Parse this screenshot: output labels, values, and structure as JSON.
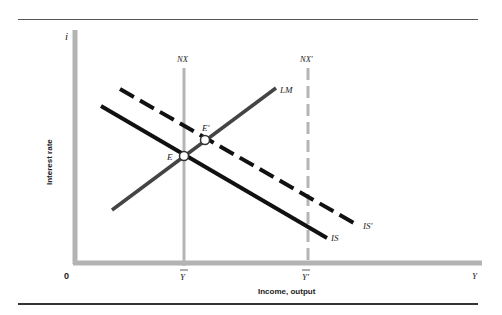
{
  "figure": {
    "type": "IS-LM diagram with NX schedule",
    "axes": {
      "y_axis_symbol": "i",
      "y_axis_title": "Interest rate",
      "x_axis_symbol": "Y",
      "x_axis_title": "Income, output",
      "origin_label": "0"
    },
    "x_ticks": [
      {
        "label": "Y̅",
        "key": "Ybar"
      },
      {
        "label": "Y̅′",
        "key": "Ybar_prime"
      }
    ],
    "curves": [
      {
        "name": "IS",
        "label": "IS",
        "style": "solid",
        "color": "#111111"
      },
      {
        "name": "IS_prime",
        "label": "IS′",
        "style": "dashed",
        "color": "#111111"
      },
      {
        "name": "LM",
        "label": "LM",
        "style": "solid",
        "color": "#444444"
      },
      {
        "name": "NX",
        "label": "NX",
        "style": "solid",
        "color": "#b5b5b5"
      },
      {
        "name": "NX_prime",
        "label": "NX′",
        "style": "dashed",
        "color": "#b5b5b5"
      }
    ],
    "points": [
      {
        "name": "E",
        "label": "E"
      },
      {
        "name": "E_prime",
        "label": "E′"
      }
    ],
    "labels": {
      "i": "i",
      "interest_rate": "Interest rate",
      "Y": "Y",
      "income_output": "Income, output",
      "zero": "0",
      "Ybar": "Y",
      "Ybar_prime": "Y′",
      "IS": "IS",
      "IS_prime": "IS′",
      "LM": "LM",
      "NX": "NX",
      "NX_prime": "NX′",
      "E": "E",
      "E_prime": "E′"
    },
    "colors": {
      "axis": "#b3b3b3",
      "is_curve": "#111111",
      "lm_curve": "#444444",
      "nx_line": "#b5b5b5",
      "rule": "#444444"
    }
  }
}
